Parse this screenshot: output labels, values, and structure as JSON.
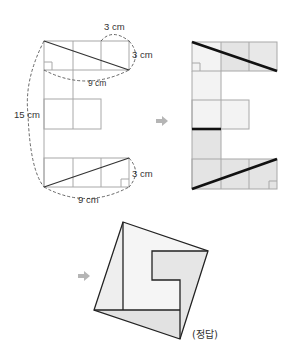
{
  "figure_left": {
    "name": "E-shape grid with measurements",
    "labels": {
      "top_width": "3 cm",
      "top_height": "3 cm",
      "top_length": "9 cm",
      "total_height": "15 cm",
      "bottom_height": "3 cm",
      "bottom_length": "9 cm"
    }
  },
  "figure_right": {
    "name": "E-shape cut lines highlighted"
  },
  "figure_answer": {
    "name": "Rearranged square",
    "label": "(정답)"
  },
  "colors": {
    "grid_line": "#a8a8a8",
    "bold_line": "#111111",
    "shade_light": "#f3f3f3",
    "shade_dark": "#e4e4e4",
    "arrow": "#b5b5b5",
    "dashed": "#555555"
  }
}
